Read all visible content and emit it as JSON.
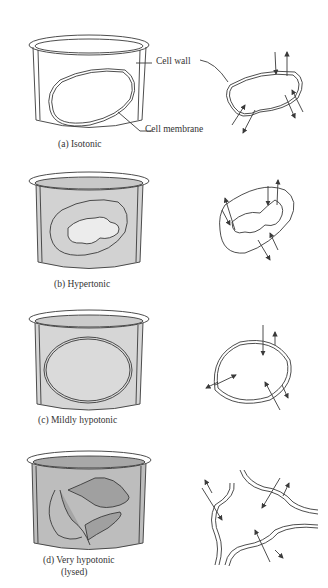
{
  "diagram": {
    "panels": [
      {
        "id": "a",
        "caption": "(a) Isotonic",
        "solution_fill": "#ffffff"
      },
      {
        "id": "b",
        "caption": "(b) Hypertonic",
        "solution_fill": "#d2d2d2"
      },
      {
        "id": "c",
        "caption": "(c) Mildly hypotonic",
        "solution_fill": "#d6d6d6"
      },
      {
        "id": "d",
        "caption_line1": "(d) Very hypotonic",
        "caption_line2": "(lysed)",
        "solution_fill": "#bdbdbd"
      }
    ],
    "callouts": {
      "cell_wall": "Cell wall",
      "cell_membrane": "Cell membrane"
    },
    "colors": {
      "line": "#3a3a3a",
      "background": "#ffffff"
    }
  }
}
